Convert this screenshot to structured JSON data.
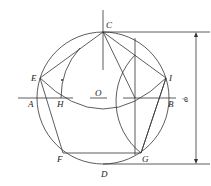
{
  "diagram": {
    "center": {
      "label": "O",
      "x": 103,
      "y": 98
    },
    "radius": 66,
    "points": [
      {
        "label": "C",
        "x": 103,
        "y": 32,
        "lx": 106,
        "ly": 28
      },
      {
        "label": "E",
        "x": 40,
        "y": 78,
        "lx": 31,
        "ly": 81
      },
      {
        "label": "I",
        "x": 166,
        "y": 78,
        "lx": 169,
        "ly": 81
      },
      {
        "label": "F",
        "x": 63,
        "y": 153,
        "lx": 57,
        "ly": 162
      },
      {
        "label": "G",
        "x": 141,
        "y": 153,
        "lx": 142,
        "ly": 162
      },
      {
        "label": "A",
        "x": 37,
        "y": 98,
        "lx": 28,
        "ly": 107
      },
      {
        "label": "H",
        "x": 61,
        "y": 98,
        "lx": 57,
        "ly": 107
      },
      {
        "label": "B",
        "x": 169,
        "y": 98,
        "lx": 168,
        "ly": 107
      },
      {
        "label": "D",
        "x": 103,
        "y": 164,
        "lx": 101,
        "ly": 177
      },
      {
        "label": "O",
        "x": 103,
        "y": 98,
        "lx": 95,
        "ly": 96
      }
    ],
    "dimension_label": "φ",
    "colors": {
      "line": "#333333",
      "background": "#ffffff"
    }
  }
}
